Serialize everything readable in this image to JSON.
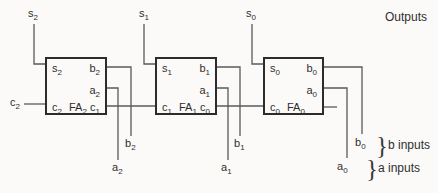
{
  "colors": {
    "background": "#fbfaf8",
    "wire": "#5a5a5a",
    "box_border": "#2c2c2c",
    "text": "#2e2e2e"
  },
  "annotations": {
    "outputs": "Outputs",
    "brace": "}",
    "b_inputs": "b inputs",
    "a_inputs": "a inputs"
  },
  "carry_out": {
    "base": "c",
    "sub": "2"
  },
  "adders": [
    {
      "name": "FA2",
      "box_label": {
        "base": "FA",
        "sub": "2"
      },
      "pins": {
        "sum": {
          "base": "s",
          "sub": "2"
        },
        "b": {
          "base": "b",
          "sub": "2"
        },
        "a": {
          "base": "a",
          "sub": "2"
        },
        "carry_left": {
          "base": "c",
          "sub": "2"
        },
        "carry_right": {
          "base": "c",
          "sub": "1"
        }
      },
      "external": {
        "sum": {
          "base": "s",
          "sub": "2"
        },
        "b": {
          "base": "b",
          "sub": "2"
        },
        "a": {
          "base": "a",
          "sub": "2"
        }
      }
    },
    {
      "name": "FA1",
      "box_label": {
        "base": "FA",
        "sub": "1"
      },
      "pins": {
        "sum": {
          "base": "s",
          "sub": "1"
        },
        "b": {
          "base": "b",
          "sub": "1"
        },
        "a": {
          "base": "a",
          "sub": "1"
        },
        "carry_left": {
          "base": "c",
          "sub": "1"
        },
        "carry_right": {
          "base": "c",
          "sub": "0"
        }
      },
      "external": {
        "sum": {
          "base": "s",
          "sub": "1"
        },
        "b": {
          "base": "b",
          "sub": "1"
        },
        "a": {
          "base": "a",
          "sub": "1"
        }
      }
    },
    {
      "name": "FA0",
      "box_label": {
        "base": "FA",
        "sub": "0"
      },
      "pins": {
        "sum": {
          "base": "s",
          "sub": "0"
        },
        "b": {
          "base": "b",
          "sub": "0"
        },
        "a": {
          "base": "a",
          "sub": "0"
        },
        "carry_left": {
          "base": "c",
          "sub": "0"
        }
      },
      "external": {
        "sum": {
          "base": "s",
          "sub": "0"
        },
        "b": {
          "base": "b",
          "sub": "0"
        },
        "a": {
          "base": "a",
          "sub": "0"
        }
      }
    }
  ]
}
